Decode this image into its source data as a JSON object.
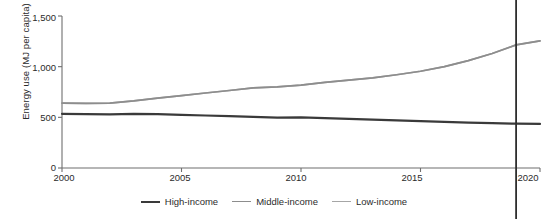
{
  "figure": {
    "cut_off_title_fragment": "",
    "background": "#ffffff"
  },
  "axes": {
    "ylabel": "Energy use (MJ per capita)",
    "xlabel": "",
    "yticks": [
      "0",
      "500",
      "1,000",
      "1,500"
    ],
    "xticks": [
      "2000",
      "2005",
      "2010",
      "2015",
      "2020"
    ],
    "axis_color": "#6f6f6f"
  },
  "legend": {
    "position": "bottom-center",
    "items": [
      {
        "label": "High-income",
        "color": "#3a3a3a"
      },
      {
        "label": "Middle-income",
        "color": "#8d8d8d"
      },
      {
        "label": "Low-income",
        "color": "#a6a6a6"
      }
    ]
  },
  "marker_line": {
    "year": 2019,
    "color": "#2e2e2e",
    "label": ""
  },
  "chart_data": {
    "type": "line",
    "title": "",
    "xlabel": "",
    "ylabel": "Energy use (MJ per capita)",
    "xlim": [
      2000,
      2020
    ],
    "ylim": [
      0,
      1500
    ],
    "grid": false,
    "legend_position": "bottom-center",
    "x": [
      2000,
      2001,
      2002,
      2003,
      2004,
      2005,
      2006,
      2007,
      2008,
      2009,
      2010,
      2011,
      2012,
      2013,
      2014,
      2015,
      2016,
      2017,
      2018,
      2019,
      2020
    ],
    "series": [
      {
        "name": "High-income",
        "color": "#3a3a3a",
        "values": [
          535,
          532,
          530,
          534,
          531,
          525,
          518,
          512,
          505,
          498,
          500,
          492,
          484,
          478,
          470,
          462,
          455,
          448,
          442,
          437,
          435
        ]
      },
      {
        "name": "Middle-income",
        "color": "#8d8d8d",
        "values": [
          640,
          637,
          640,
          662,
          690,
          715,
          740,
          765,
          790,
          800,
          818,
          845,
          868,
          890,
          920,
          955,
          1000,
          1060,
          1130,
          1215,
          1255
        ]
      },
      {
        "name": "Low-income",
        "color": "#a6a6a6",
        "values": [
          640,
          637,
          640,
          662,
          690,
          715,
          740,
          765,
          790,
          800,
          818,
          845,
          868,
          890,
          920,
          955,
          1000,
          1060,
          1130,
          1215,
          1255
        ]
      }
    ]
  }
}
